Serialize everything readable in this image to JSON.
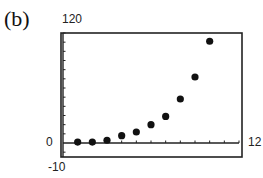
{
  "panel_label": "(b)",
  "window": {
    "xmin": 0,
    "xmax": 12,
    "ymin": -10,
    "ymax": 120
  },
  "labels": {
    "ymax": "120",
    "ymin": "-10",
    "xmax": "12",
    "yzero": "0"
  },
  "chart_data": {
    "type": "scatter",
    "title": "(b)",
    "xlabel": "",
    "ylabel": "",
    "xlim": [
      0,
      12
    ],
    "ylim": [
      -10,
      120
    ],
    "x_tick_step": 1,
    "y_tick_step": 10,
    "grid": false,
    "tick_labels": {
      "xmax": "12",
      "ymax": "120",
      "ymin": "-10",
      "y_origin": "0"
    },
    "x": [
      1,
      2,
      3,
      4,
      5,
      6,
      7,
      8,
      9,
      10
    ],
    "y": [
      1,
      1,
      3,
      8,
      12,
      20,
      29,
      48,
      72,
      111
    ],
    "marker_color": "#111111"
  }
}
